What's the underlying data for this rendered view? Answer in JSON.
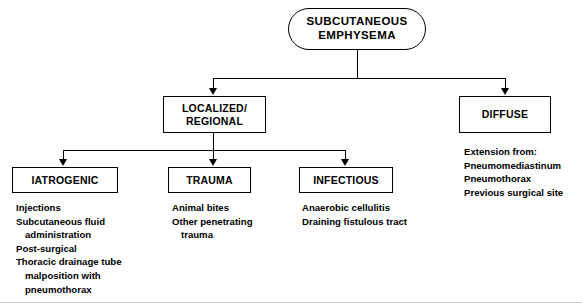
{
  "diagram": {
    "root": {
      "label": "SUBCUTANEOUS\nEMPHYSEMA",
      "line1": "SUBCUTANEOUS",
      "line2": "EMPHYSEMA"
    },
    "level2": {
      "localized": {
        "line1": "LOCALIZED/",
        "line2": "REGIONAL"
      },
      "diffuse": {
        "label": "DIFFUSE",
        "details": {
          "line1": "Extension from:",
          "line2": "Pneumomediastinum",
          "line3": "Pneumothorax",
          "line4": "Previous surgical site"
        }
      }
    },
    "level3": {
      "iatrogenic": {
        "label": "IATROGENIC",
        "details": {
          "line1": "Injections",
          "line2": "Subcutaneous fluid",
          "line3": "administration",
          "line4": "Post-surgical",
          "line5": "Thoracic drainage tube",
          "line6": "malposition with",
          "line7": "pneumothorax"
        }
      },
      "trauma": {
        "label": "TRAUMA",
        "details": {
          "line1": "Animal bites",
          "line2": "Other penetrating",
          "line3": "trauma"
        }
      },
      "infectious": {
        "label": "INFECTIOUS",
        "details": {
          "line1": "Anaerobic cellulitis",
          "line2": "Draining fistulous tract"
        }
      }
    },
    "colors": {
      "stroke": "#000000",
      "background": "#ffffff",
      "text": "#000000"
    }
  }
}
